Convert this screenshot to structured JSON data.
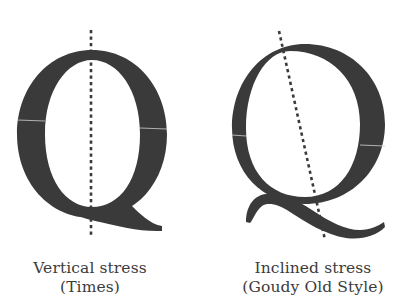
{
  "figure": {
    "letter": "Q",
    "glyph_color": "#3a3a3a",
    "guide_color": "#3a3a3a",
    "left": {
      "caption_line1": "Vertical stress",
      "caption_line2": "(Times)",
      "stress_axis": "vertical"
    },
    "right": {
      "caption_line1": "Inclined stress",
      "caption_line2": "(Goudy Old Style)",
      "stress_axis": "inclined"
    }
  }
}
